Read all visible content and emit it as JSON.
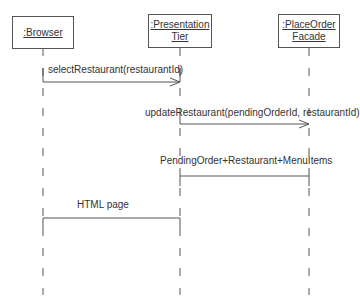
{
  "diagram": {
    "type": "sequence",
    "colors": {
      "line": "#555555",
      "text": "#333333",
      "background": "#ffffff"
    },
    "participants": [
      {
        "id": "browser",
        "lines": [
          ":Browser"
        ]
      },
      {
        "id": "presentation",
        "lines": [
          ":Presentation",
          "Tier"
        ]
      },
      {
        "id": "facade",
        "lines": [
          ":PlaceOrder",
          "Facade"
        ]
      }
    ],
    "messages": [
      {
        "from": "browser",
        "to": "presentation",
        "label": "selectRestaurant(restaurantId)",
        "kind": "call"
      },
      {
        "from": "presentation",
        "to": "facade",
        "label": "updateRestaurant(pendingOrderId, restaurantId)",
        "kind": "call"
      },
      {
        "from": "facade",
        "to": "presentation",
        "label": "PendingOrder+Restaurant+MenuItems",
        "kind": "return"
      },
      {
        "from": "presentation",
        "to": "browser",
        "label": "HTML page",
        "kind": "return"
      }
    ]
  }
}
